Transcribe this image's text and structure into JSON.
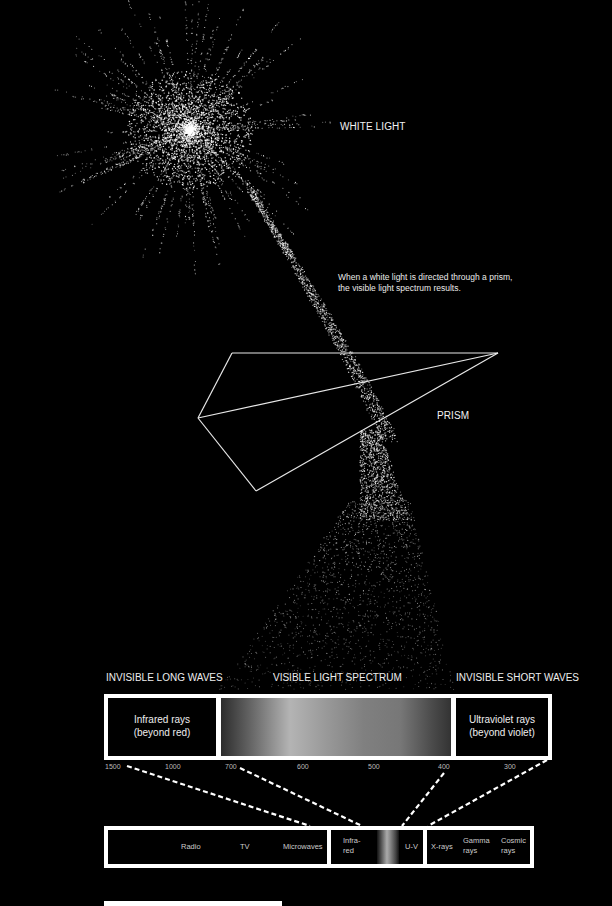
{
  "labels": {
    "white_light": "WHITE LIGHT",
    "caption_line1": "When a white light is directed through a prism,",
    "caption_line2": "the visible light spectrum results.",
    "prism": "PRISM"
  },
  "spectrum_headers": {
    "long": "INVISIBLE LONG WAVES",
    "visible": "VISIBLE LIGHT SPECTRUM",
    "short": "INVISIBLE SHORT WAVES"
  },
  "main_bar": {
    "left_line1": "Infrared rays",
    "left_line2": "(beyond red)",
    "right_line1": "Ultraviolet rays",
    "right_line2": "(beyond violet)"
  },
  "wavelength_ticks": [
    {
      "label": "1500",
      "x": 105
    },
    {
      "label": "1000",
      "x": 165
    },
    {
      "label": "700",
      "x": 225
    },
    {
      "label": "600",
      "x": 297
    },
    {
      "label": "500",
      "x": 368
    },
    {
      "label": "400",
      "x": 438
    },
    {
      "label": "300",
      "x": 504
    }
  ],
  "em_bar": {
    "radio": "Radio",
    "tv": "TV",
    "microwaves": "Microwaves",
    "infrared_line1": "Infra-",
    "infrared_line2": "red",
    "uv": "U-V",
    "xrays": "X-rays",
    "gamma_line1": "Gamma",
    "gamma_line2": "rays",
    "cosmic_line1": "Cosmic",
    "cosmic_line2": "rays"
  },
  "colors": {
    "background": "#000000",
    "lines": "#ffffff"
  }
}
